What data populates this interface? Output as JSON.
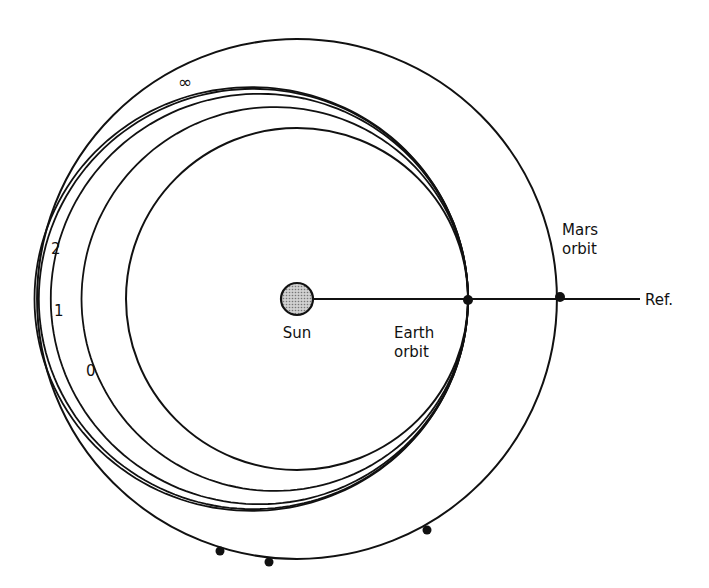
{
  "diagram": {
    "labels": {
      "sun": "Sun",
      "earth_orbit_line1": "Earth",
      "earth_orbit_line2": "orbit",
      "mars_orbit_line1": "Mars",
      "mars_orbit_line2": "orbit",
      "reference": "Ref."
    },
    "orbit_ratio_mars_to_earth": 1.52,
    "transfer_orbits": [
      {
        "label": "0",
        "aphelion_ratio": 1.26
      },
      {
        "label": "1",
        "aphelion_ratio": 1.44
      },
      {
        "label": "2",
        "aphelion_ratio": 1.51
      },
      {
        "label": "∞",
        "aphelion_ratio": 1.535
      }
    ],
    "colors": {
      "line": "#111111",
      "sun_fill": "#aaaaaa",
      "background": "#ffffff"
    }
  }
}
